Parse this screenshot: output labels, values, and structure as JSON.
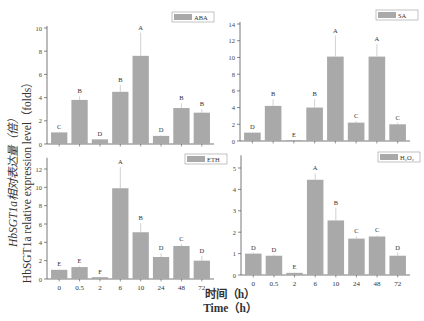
{
  "figure": {
    "y_axis_label_cn": "HbSGT1a相对表达量（倍）",
    "y_axis_label_en": "HbSGT1a relative expression level（folds）",
    "x_axis_label_cn": "时间（h）",
    "x_axis_label_en": "Time（h）",
    "bar_color": "#a9a9a9",
    "error_color": "#bdbdbd"
  },
  "chart_data": [
    {
      "type": "bar",
      "title": "ABA",
      "legend": "ABA",
      "categories": [
        "0",
        "0.5",
        "2",
        "6",
        "10",
        "24",
        "48",
        "72"
      ],
      "values": [
        1.0,
        3.8,
        0.4,
        4.5,
        7.6,
        0.7,
        3.1,
        2.7
      ],
      "errors": [
        0.05,
        0.3,
        0.05,
        0.6,
        2.0,
        0.05,
        0.4,
        0.3
      ],
      "letters": [
        "C",
        "B",
        "D",
        "B",
        "A",
        "D",
        "B",
        "B"
      ],
      "ylim": [
        0,
        10
      ],
      "yticks": [
        0,
        2,
        4,
        6,
        8,
        10
      ],
      "xlabel": "Time (h)",
      "ylabel": "HbSGT1a relative expression level (folds)",
      "show_xticklabels": false,
      "grid": false,
      "legend_position": "top-right"
    },
    {
      "type": "bar",
      "title": "SA",
      "legend": "SA",
      "categories": [
        "0",
        "0.5",
        "2",
        "6",
        "10",
        "24",
        "48",
        "72"
      ],
      "values": [
        1.0,
        4.2,
        0.1,
        4.0,
        10.1,
        2.2,
        10.1,
        2.0
      ],
      "errors": [
        0.05,
        0.8,
        0.02,
        1.0,
        2.5,
        0.2,
        1.5,
        0.2
      ],
      "letters": [
        "D",
        "B",
        "E",
        "B",
        "A",
        "C",
        "A",
        "C"
      ],
      "ylim": [
        0,
        14
      ],
      "yticks": [
        0,
        2,
        4,
        6,
        8,
        10,
        12,
        14
      ],
      "xlabel": "Time (h)",
      "ylabel": "",
      "show_xticklabels": false,
      "grid": false,
      "legend_position": "top-right"
    },
    {
      "type": "bar",
      "title": "ETH",
      "legend": "ETH",
      "categories": [
        "0",
        "0.5",
        "2",
        "6",
        "10",
        "24",
        "48",
        "72"
      ],
      "values": [
        1.0,
        1.3,
        0.2,
        9.9,
        5.1,
        2.4,
        3.6,
        2.0
      ],
      "errors": [
        0.05,
        0.1,
        0.03,
        2.3,
        1.0,
        0.4,
        0.2,
        0.5
      ],
      "letters": [
        "E",
        "E",
        "F",
        "A",
        "B",
        "D",
        "C",
        "D"
      ],
      "ylim": [
        0,
        13
      ],
      "yticks": [
        0,
        2,
        4,
        6,
        8,
        10,
        12
      ],
      "xlabel": "Time (h)",
      "ylabel": "HbSGT1a relative expression level (folds)",
      "show_xticklabels": true,
      "grid": false,
      "legend_position": "top-right"
    },
    {
      "type": "bar",
      "title": "H2O2",
      "legend": "H₂O₂",
      "categories": [
        "0",
        "0.5",
        "2",
        "6",
        "10",
        "24",
        "48",
        "72"
      ],
      "values": [
        1.0,
        0.9,
        0.1,
        4.45,
        2.55,
        1.7,
        1.8,
        0.9
      ],
      "errors": [
        0.05,
        0.05,
        0.02,
        0.3,
        0.6,
        0.1,
        0.05,
        0.15
      ],
      "letters": [
        "D",
        "D",
        "E",
        "A",
        "B",
        "C",
        "C",
        "D"
      ],
      "ylim": [
        0,
        5.5
      ],
      "yticks": [
        0,
        1,
        2,
        3,
        4,
        5
      ],
      "xlabel": "Time (h)",
      "ylabel": "",
      "show_xticklabels": true,
      "grid": false,
      "legend_position": "top-right"
    }
  ],
  "layout": {
    "panels": [
      {
        "x0": 47,
        "y0": 144,
        "ytop": 28,
        "ymaxTick": 10,
        "xend": 214,
        "legend_x": 172,
        "legend_y": 12
      },
      {
        "x0": 240,
        "y0": 141,
        "ytop": 24,
        "ymaxTick": 14,
        "xend": 410,
        "legend_x": 376,
        "legend_y": 10
      },
      {
        "x0": 47,
        "y0": 279,
        "ytop": 169,
        "ymaxTick": 12,
        "xend": 214,
        "legend_x": 185,
        "legend_y": 154
      },
      {
        "x0": 241,
        "y0": 275,
        "ytop": 168,
        "ymaxTick": 5,
        "xend": 410,
        "legend_x": 378,
        "legend_y": 152
      }
    ]
  }
}
